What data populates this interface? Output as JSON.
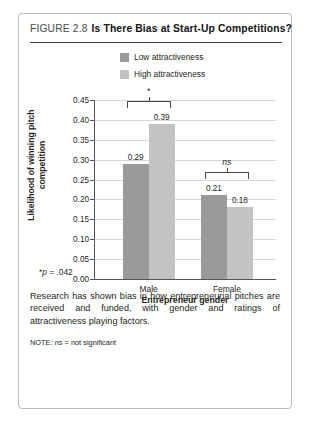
{
  "figure": {
    "number_label": "FIGURE 2.8",
    "title": "Is There Bias at Start-Up Competitions?",
    "footnote_star": "*",
    "footnote_p_italic": "p",
    "footnote_rest": " = .042",
    "body": "Research has shown bias in how entrepreneurial pitches are received and funded, with gender and ratings of attractiveness playing factors.",
    "note_prefix": "NOTE: ",
    "note_italic": "ns",
    "note_rest": " = not significant"
  },
  "chart_data": {
    "type": "bar",
    "title": "Is There Bias at Start-Up Competitions?",
    "categories": [
      "Male",
      "Female"
    ],
    "series": [
      {
        "name": "Low attractiveness",
        "values": [
          0.29,
          0.21
        ],
        "color": "#9a9a9a"
      },
      {
        "name": "High attractiveness",
        "values": [
          0.39,
          0.18
        ],
        "color": "#c3c3c3"
      }
    ],
    "xlabel": "Entrepreneur gender",
    "ylabel": "Likelihood of winning pitch competition",
    "ylim": [
      0.0,
      0.45
    ],
    "ytick_step": 0.05,
    "ytick_labels": [
      "0.45",
      "0.40",
      "0.35",
      "0.30",
      "0.25",
      "0.20",
      "0.15",
      "0.10",
      "0.05",
      "0.00"
    ],
    "grid": true,
    "legend_position": "top",
    "data_labels": [
      "0.29",
      "0.39",
      "0.21",
      "0.18"
    ],
    "annotations": [
      {
        "group": "Male",
        "label": "*",
        "italic": false,
        "significant": true
      },
      {
        "group": "Female",
        "label": "ns",
        "italic": true,
        "significant": false
      }
    ]
  }
}
